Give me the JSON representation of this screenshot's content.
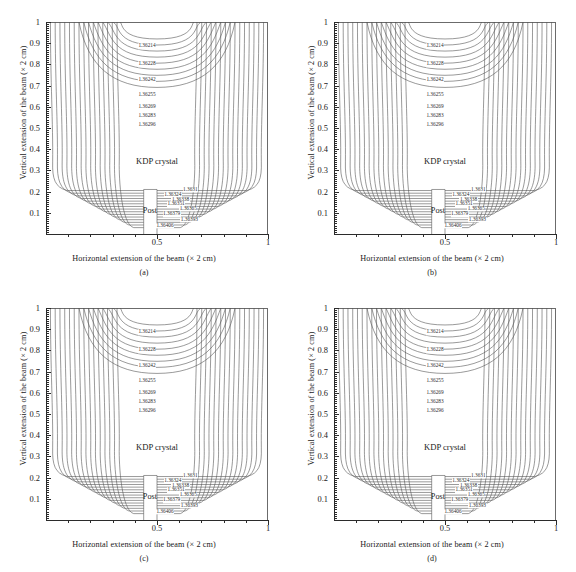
{
  "figure": {
    "panels": [
      "a",
      "b",
      "c",
      "d"
    ],
    "tags": [
      "(a)",
      "(b)",
      "(c)",
      "(d)"
    ]
  },
  "axes": {
    "xlabel": "Horizontal extension of the beam (× 2 cm)",
    "ylabel": "Vertical extension of the beam (× 2 cm)",
    "x_ticklabels": [
      "0.5",
      "1"
    ],
    "x_tickvalues": [
      0.5,
      1
    ],
    "y_ticklabels": [
      "0.1",
      "0.2",
      "0.3",
      "0.4",
      "0.5",
      "0.6",
      "0.7",
      "0.8",
      "0.9",
      "1"
    ],
    "y_tickvalues": [
      0.1,
      0.2,
      0.3,
      0.4,
      0.5,
      0.6,
      0.7,
      0.8,
      0.9,
      1
    ],
    "xlim": [
      0,
      1
    ],
    "ylim": [
      0,
      1
    ]
  },
  "annotations": {
    "crystal": "KDP crystal",
    "post": "Post"
  },
  "chart_data": {
    "type": "contour",
    "title": "",
    "xlabel": "Horizontal extension of the beam (× 2 cm)",
    "ylabel": "Vertical extension of the beam (× 2 cm)",
    "xlim": [
      0,
      1
    ],
    "ylim": [
      0,
      1
    ],
    "grid": false,
    "legend": "none",
    "quantity": "refractive index",
    "panel_count": 4,
    "panel_labels": [
      "(a)",
      "(b)",
      "(c)",
      "(d)"
    ],
    "upper_contour_labels": [
      "1.36214",
      "1.36228",
      "1.36242",
      "1.36255",
      "1.36269",
      "1.36283",
      "1.36296"
    ],
    "upper_contour_values": [
      1.36214,
      1.36228,
      1.36242,
      1.36255,
      1.36269,
      1.36283,
      1.36296
    ],
    "upper_label_y": [
      0.885,
      0.8,
      0.725,
      0.655,
      0.6,
      0.555,
      0.515
    ],
    "upper_label_x": [
      0.455,
      0.455,
      0.455,
      0.455,
      0.455,
      0.455,
      0.455
    ],
    "lower_contour_labels": [
      "1.3631",
      "1.36324",
      "1.36338",
      "1.36351",
      "1.36365",
      "1.36379",
      "1.36393",
      "1.36406"
    ],
    "lower_contour_values": [
      1.3631,
      1.36324,
      1.36338,
      1.36351,
      1.36365,
      1.36379,
      1.36393,
      1.36406
    ],
    "lower_label_y": [
      0.208,
      0.184,
      0.162,
      0.14,
      0.12,
      0.093,
      0.068,
      0.038
    ],
    "lower_label_x": [
      0.705,
      0.62,
      0.655,
      0.635,
      0.69,
      0.615,
      0.695,
      0.585
    ],
    "contour_level_count": 15,
    "region_label": "KDP crystal",
    "obstacle_label": "Post",
    "post_x_range": [
      0.44,
      0.5
    ],
    "post_y_range": [
      0.0,
      0.21
    ],
    "line_color": "#555555"
  }
}
